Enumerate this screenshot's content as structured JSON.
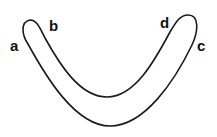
{
  "diagram": {
    "shape": "boomerang",
    "stroke_color": "#1a1a1a",
    "labels": [
      {
        "id": "a",
        "text": "a"
      },
      {
        "id": "b",
        "text": "b"
      },
      {
        "id": "c",
        "text": "c"
      },
      {
        "id": "d",
        "text": "d"
      }
    ]
  }
}
